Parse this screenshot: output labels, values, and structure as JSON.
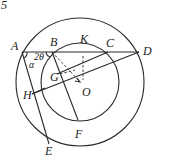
{
  "figure_number": "5",
  "labels": {
    "A": "A",
    "B": "B",
    "K": "K",
    "C": "C",
    "D": "D",
    "G": "G",
    "O": "O",
    "H": "H",
    "F": "F",
    "E": "E",
    "alpha": "α",
    "two_theta": "2θ"
  },
  "colors": {
    "stroke": "#2a2a2a",
    "background": "#ffffff"
  }
}
